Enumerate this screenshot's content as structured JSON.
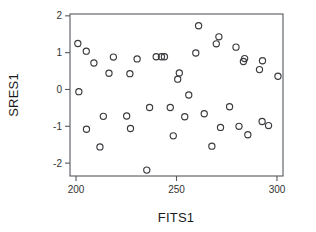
{
  "chart_data": {
    "type": "scatter",
    "title": "",
    "xlabel": "FITS1",
    "ylabel": "SRES1",
    "xlim": [
      197,
      303
    ],
    "ylim": [
      -2.35,
      2.05
    ],
    "xticks": [
      200,
      250,
      300
    ],
    "xtick_labels": [
      "200",
      "250",
      "300"
    ],
    "yticks": [
      2,
      1,
      0,
      -1,
      -2
    ],
    "ytick_labels": [
      "2",
      "1",
      "0",
      "-1",
      "-2"
    ],
    "grid": false,
    "legend": null,
    "marker": "open-circle",
    "marker_color": "#3b3b3f",
    "points": [
      {
        "x": 200.9,
        "y": 1.25
      },
      {
        "x": 201.4,
        "y": -0.06
      },
      {
        "x": 205.1,
        "y": 1.04
      },
      {
        "x": 205.2,
        "y": -1.08
      },
      {
        "x": 208.9,
        "y": 0.72
      },
      {
        "x": 211.9,
        "y": -1.56
      },
      {
        "x": 213.6,
        "y": -0.73
      },
      {
        "x": 216.4,
        "y": 0.44
      },
      {
        "x": 218.6,
        "y": 0.88
      },
      {
        "x": 225.2,
        "y": -0.72
      },
      {
        "x": 226.8,
        "y": 0.43
      },
      {
        "x": 227.1,
        "y": -1.06
      },
      {
        "x": 230.4,
        "y": 0.83
      },
      {
        "x": 235.2,
        "y": -2.19
      },
      {
        "x": 236.6,
        "y": -0.49
      },
      {
        "x": 239.9,
        "y": 0.89
      },
      {
        "x": 242.5,
        "y": 0.89
      },
      {
        "x": 244.0,
        "y": 0.89
      },
      {
        "x": 246.9,
        "y": -0.49
      },
      {
        "x": 248.4,
        "y": -1.26
      },
      {
        "x": 250.6,
        "y": 0.28
      },
      {
        "x": 251.4,
        "y": 0.45
      },
      {
        "x": 254.1,
        "y": -0.74
      },
      {
        "x": 256.1,
        "y": -0.15
      },
      {
        "x": 259.6,
        "y": 0.99
      },
      {
        "x": 261.0,
        "y": 1.73
      },
      {
        "x": 263.8,
        "y": -0.66
      },
      {
        "x": 267.6,
        "y": -1.54
      },
      {
        "x": 269.8,
        "y": 1.24
      },
      {
        "x": 271.1,
        "y": 1.43
      },
      {
        "x": 271.9,
        "y": -1.03
      },
      {
        "x": 276.4,
        "y": -0.47
      },
      {
        "x": 279.6,
        "y": 1.15
      },
      {
        "x": 281.1,
        "y": -1.0
      },
      {
        "x": 283.3,
        "y": 0.76
      },
      {
        "x": 283.9,
        "y": 0.84
      },
      {
        "x": 285.5,
        "y": -1.23
      },
      {
        "x": 291.3,
        "y": 0.54
      },
      {
        "x": 292.6,
        "y": -0.87
      },
      {
        "x": 292.8,
        "y": 0.78
      },
      {
        "x": 295.8,
        "y": -0.98
      },
      {
        "x": 300.5,
        "y": 0.36
      }
    ]
  }
}
